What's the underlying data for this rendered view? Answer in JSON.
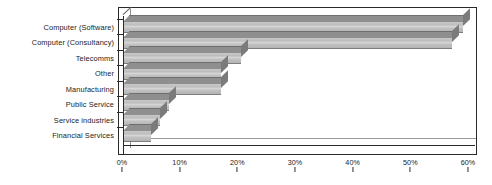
{
  "chart_data": {
    "type": "bar",
    "orientation": "horizontal",
    "title": "",
    "subtitle": "",
    "xlabel": "",
    "ylabel": "",
    "xlim": [
      0,
      60
    ],
    "grid": false,
    "legend": null,
    "tick_suffix": "%",
    "categories": [
      "Computer (Software)",
      "Computer (Consultancy)",
      "Telecomms",
      "Other",
      "Manufacturing",
      "Public Service",
      "Service industries",
      "Financial Services"
    ],
    "values": [
      59,
      57,
      20.5,
      17,
      17,
      8,
      6.5,
      4.8
    ],
    "xticks": [
      0,
      10,
      20,
      30,
      40,
      50,
      60
    ],
    "xtick_labels": [
      "0%",
      "10%",
      "20%",
      "30%",
      "40%",
      "50%",
      "60%"
    ],
    "colors": {
      "bar_front": "#c4c4c4",
      "bar_top": "#8f8f8f",
      "bar_side": "#7b7b7b",
      "axis": "#2b2b2b",
      "text": "#1b1b1b",
      "background": "#ffffff"
    }
  }
}
